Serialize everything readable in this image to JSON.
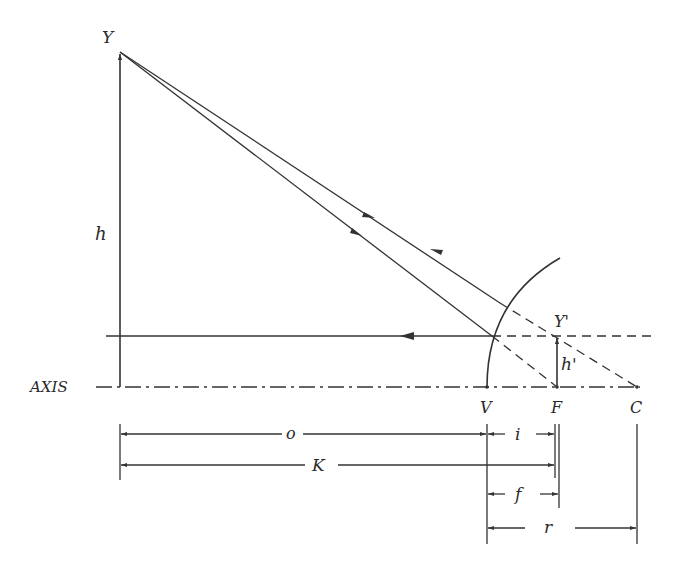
{
  "diagram": {
    "labels": {
      "object_tip": "Y",
      "image_tip": "Y'",
      "object_height": "h",
      "image_height": "h'",
      "axis": "AXIS",
      "vertex": "V",
      "focus": "F",
      "center": "C"
    },
    "dimensions": {
      "object_distance": "o",
      "image_distance": "i",
      "object_to_focus": "K",
      "focal_length": "f",
      "radius": "r"
    },
    "colors": {
      "line": "#333333",
      "text": "#2a2a2a",
      "background": "#ffffff"
    }
  }
}
